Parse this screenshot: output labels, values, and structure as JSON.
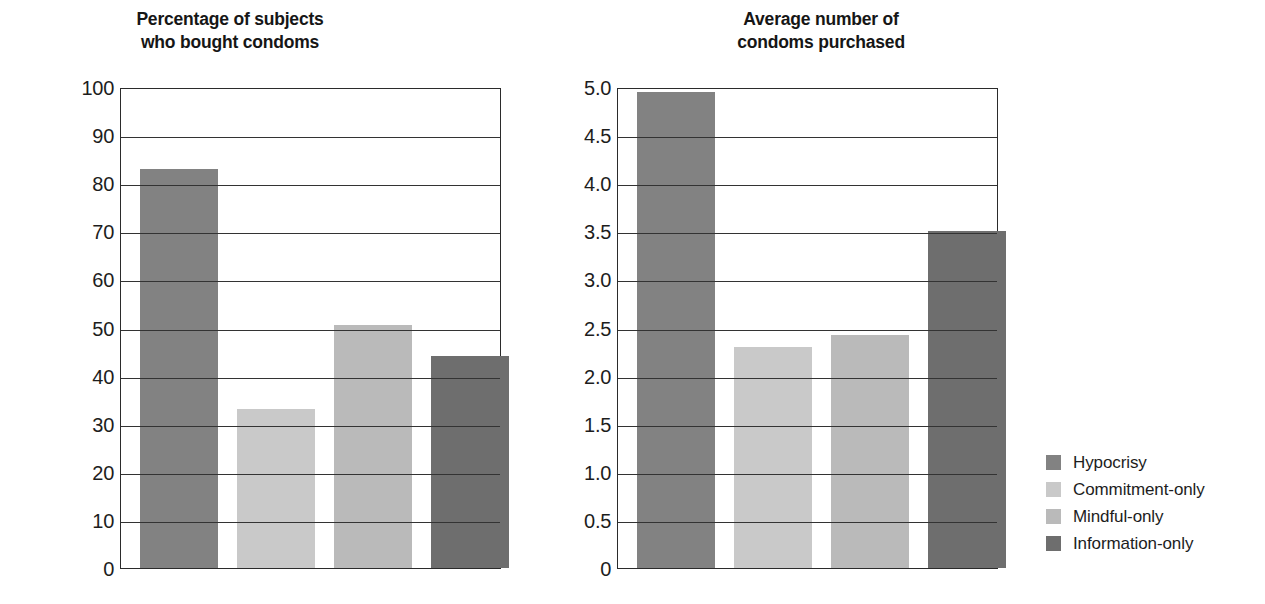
{
  "figure": {
    "background_color": "#ffffff",
    "axis_color": "#2b2b2b"
  },
  "series_colors": {
    "hypocrisy": "#828282",
    "commitment_only": "#c9c9c9",
    "mindful_only": "#bababa",
    "information_only": "#6e6e6e"
  },
  "legend": {
    "items": [
      {
        "label": "Hypocrisy",
        "color": "#828282"
      },
      {
        "label": "Commitment-only",
        "color": "#c9c9c9"
      },
      {
        "label": "Mindful-only",
        "color": "#bababa"
      },
      {
        "label": "Information-only",
        "color": "#6e6e6e"
      }
    ]
  },
  "chart_data": [
    {
      "type": "bar",
      "id": "percentage-bought-condoms",
      "title": "Percentage of subjects\nwho bought condoms",
      "xlabel": "",
      "ylabel": "",
      "ylim": [
        0,
        100
      ],
      "ytick_labels": [
        "100",
        "90",
        "80",
        "70",
        "60",
        "50",
        "40",
        "30",
        "20",
        "10",
        "0"
      ],
      "yticks": [
        100,
        90,
        80,
        70,
        60,
        50,
        40,
        30,
        20,
        10,
        0
      ],
      "grid": true,
      "legend_position": "right-outside",
      "categories": [
        "Hypocrisy",
        "Commitment-only",
        "Mindful-only",
        "Information-only"
      ],
      "values": [
        83,
        33,
        50.5,
        44
      ],
      "colors": [
        "#828282",
        "#c9c9c9",
        "#bababa",
        "#6e6e6e"
      ]
    },
    {
      "type": "bar",
      "id": "average-condoms-purchased",
      "title": "Average number of\ncondoms purchased",
      "xlabel": "",
      "ylabel": "",
      "ylim": [
        0,
        5
      ],
      "ytick_labels": [
        "5.0",
        "4.5",
        "4.0",
        "3.5",
        "3.0",
        "2.5",
        "2.0",
        "1.5",
        "1.0",
        "0.5",
        "0"
      ],
      "yticks": [
        5.0,
        4.5,
        4.0,
        3.5,
        3.0,
        2.5,
        2.0,
        1.5,
        1.0,
        0.5,
        0
      ],
      "grid": true,
      "legend_position": "right-outside",
      "categories": [
        "Hypocrisy",
        "Commitment-only",
        "Mindful-only",
        "Information-only"
      ],
      "values": [
        4.95,
        2.3,
        2.42,
        3.5
      ],
      "colors": [
        "#828282",
        "#c9c9c9",
        "#bababa",
        "#6e6e6e"
      ]
    }
  ]
}
